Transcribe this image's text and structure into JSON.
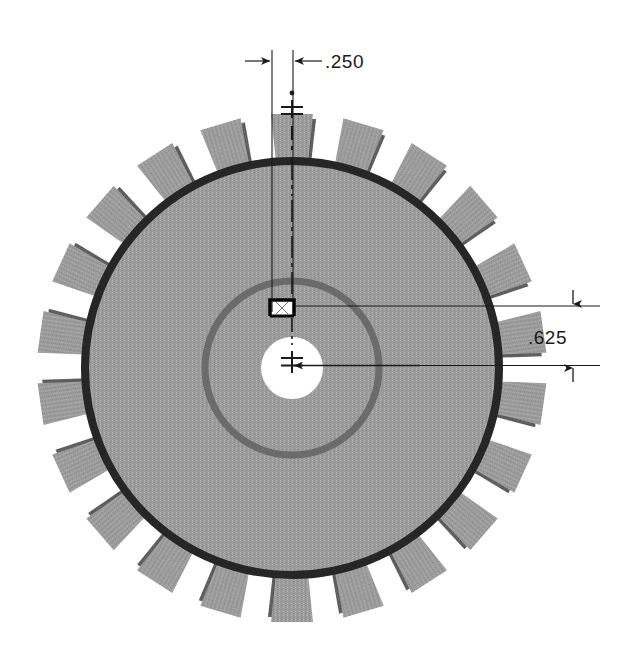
{
  "drawing": {
    "title": "Gear front view with keyway dimensions",
    "background_color": "#ffffff",
    "subject": "spur-gear"
  },
  "gear": {
    "label": "spur gear",
    "tooth_count": 22,
    "center": {
      "x": 292,
      "y": 368
    },
    "outer_radius": 255,
    "root_radius": 207,
    "root_ring_color": "#262626",
    "root_ring_width": 8,
    "body_color": "#9c9c9c",
    "tooth_face_color": "#9c9c9c",
    "tooth_shadow_color": "#5e5e5e",
    "hub_radius": 87,
    "hub_ring_color": "#6b6b6b",
    "hub_ring_width": 7,
    "bore_radius": 31,
    "bore_color": "#ffffff",
    "keyway": {
      "label": "keyway",
      "width": 24,
      "height": 16,
      "top_y": 300,
      "line_color": "#000000",
      "line_width": 3
    }
  },
  "annotations": {
    "vertical_centerline": {
      "label": "vertical centerline",
      "x": 292,
      "y_top": 88,
      "y_bottom": 360,
      "color": "#1a1a1a"
    },
    "center_mark": {
      "label": "center mark",
      "x": 292,
      "y": 368
    },
    "top_dimension": {
      "name": "keyway-width-dimension",
      "value": ".250",
      "text_x": 324,
      "text_y": 68,
      "dim_line_y": 61,
      "ext_left_x": 272,
      "ext_right_x": 293,
      "ext_top_y": 50,
      "ext_bottom_y": 310,
      "arrow_left_from_x": 244,
      "arrow_right_from_x": 320,
      "color": "#1a1a1a"
    },
    "right_dimension": {
      "name": "keyway-depth-dimension",
      "value": ".625",
      "text_x": 530,
      "text_y": 343,
      "dim_line_x": 573,
      "ext_top_y": 306,
      "ext_bottom_y": 365,
      "ext_left_x": 300,
      "ext_right_x": 600,
      "arrow_top_from_y": 290,
      "arrow_bottom_from_y": 382,
      "color": "#1a1a1a"
    },
    "bore_leader": {
      "name": "bore-center-leader",
      "from_x": 292,
      "to_x": 600,
      "y": 365
    }
  },
  "colors": {
    "ink": "#1a1a1a",
    "gear_body": "#9c9c9c",
    "gear_shadow": "#5e5e5e",
    "root_ring": "#262626",
    "hub_ring": "#6b6b6b",
    "paper": "#ffffff"
  }
}
